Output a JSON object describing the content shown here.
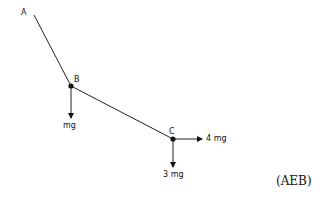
{
  "diagram": {
    "points": [
      {
        "id": "A",
        "label": "A"
      },
      {
        "id": "B",
        "label": "B"
      },
      {
        "id": "C",
        "label": "C"
      }
    ],
    "forces": {
      "B_down": "mg",
      "C_down": "3 mg",
      "C_right": "4 mg"
    },
    "source": "(AEB)"
  }
}
